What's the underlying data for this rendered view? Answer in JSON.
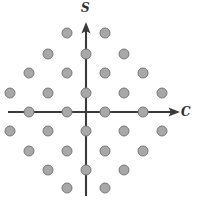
{
  "figure": {
    "title": "",
    "background_color": "#ffffff",
    "width": 198,
    "height": 201
  },
  "axes": {
    "origin": {
      "x": 86,
      "y": 112
    },
    "vertical": {
      "name": "S",
      "label": "S",
      "label_style": "italic",
      "direction": "up",
      "arrow": true,
      "color": "#3a3a3a",
      "x": 86,
      "y_top": 24,
      "y_bottom": 196
    },
    "horizontal": {
      "name": "C",
      "label": "C",
      "label_style": "italic",
      "direction": "right",
      "arrow": true,
      "color": "#3a3a3a",
      "y": 112,
      "x_left": 8,
      "x_right": 176
    }
  },
  "chart_data": {
    "type": "scatter",
    "title": "",
    "xlabel": "C",
    "ylabel": "S",
    "grid": false,
    "legend": null,
    "point_count": 37,
    "marker": {
      "shape": "circle",
      "radius_px": 5,
      "fill": "#a8a8a8",
      "stroke": "#6f6f6f",
      "stroke_width": 0.9
    },
    "lattice": {
      "description": "diamond / quincunx lattice, alternating rows offset by half spacing",
      "row_spacing_px": 19,
      "column_spacing_px": 38,
      "origin_occupied": false
    },
    "rows": [
      {
        "y": 33,
        "xs": [
          67,
          105
        ]
      },
      {
        "y": 54,
        "xs": [
          48,
          86,
          124
        ]
      },
      {
        "y": 73,
        "xs": [
          29,
          67,
          105,
          143
        ]
      },
      {
        "y": 93,
        "xs": [
          10,
          48,
          86,
          124,
          162
        ]
      },
      {
        "y": 112,
        "xs": [
          29,
          67,
          105,
          143
        ]
      },
      {
        "y": 131,
        "xs": [
          10,
          48,
          86,
          124,
          162
        ]
      },
      {
        "y": 151,
        "xs": [
          29,
          67,
          105,
          143
        ]
      },
      {
        "y": 170,
        "xs": [
          48,
          86,
          124
        ]
      },
      {
        "y": 188,
        "xs": [
          67,
          105
        ]
      }
    ],
    "points_px": [
      [
        67,
        33
      ],
      [
        105,
        33
      ],
      [
        48,
        54
      ],
      [
        86,
        54
      ],
      [
        124,
        54
      ],
      [
        29,
        73
      ],
      [
        67,
        73
      ],
      [
        105,
        73
      ],
      [
        143,
        73
      ],
      [
        10,
        93
      ],
      [
        48,
        93
      ],
      [
        86,
        93
      ],
      [
        124,
        93
      ],
      [
        162,
        93
      ],
      [
        29,
        112
      ],
      [
        67,
        112
      ],
      [
        105,
        112
      ],
      [
        143,
        112
      ],
      [
        10,
        131
      ],
      [
        48,
        131
      ],
      [
        86,
        131
      ],
      [
        124,
        131
      ],
      [
        162,
        131
      ],
      [
        29,
        151
      ],
      [
        67,
        151
      ],
      [
        105,
        151
      ],
      [
        143,
        151
      ],
      [
        48,
        170
      ],
      [
        86,
        170
      ],
      [
        124,
        170
      ],
      [
        67,
        188
      ],
      [
        105,
        188
      ]
    ],
    "points_data": [
      [
        -0.5,
        4
      ],
      [
        0.5,
        4
      ],
      [
        -1,
        3
      ],
      [
        0,
        3
      ],
      [
        1,
        3
      ],
      [
        -1.5,
        2
      ],
      [
        -0.5,
        2
      ],
      [
        0.5,
        2
      ],
      [
        1.5,
        2
      ],
      [
        -2,
        1
      ],
      [
        -1,
        1
      ],
      [
        0,
        1
      ],
      [
        1,
        1
      ],
      [
        2,
        1
      ],
      [
        -1.5,
        0
      ],
      [
        -0.5,
        0
      ],
      [
        0.5,
        0
      ],
      [
        1.5,
        0
      ],
      [
        -2,
        -1
      ],
      [
        -1,
        -1
      ],
      [
        0,
        -1
      ],
      [
        1,
        -1
      ],
      [
        2,
        -1
      ],
      [
        -1.5,
        -2
      ],
      [
        -0.5,
        -2
      ],
      [
        0.5,
        -2
      ],
      [
        1.5,
        -2
      ],
      [
        -1,
        -3
      ],
      [
        0,
        -3
      ],
      [
        1,
        -3
      ],
      [
        -0.5,
        -4
      ],
      [
        0.5,
        -4
      ]
    ]
  }
}
